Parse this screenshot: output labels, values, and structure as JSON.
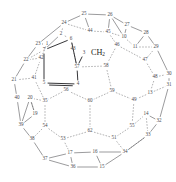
{
  "figure": {
    "kind": "fullerene-schlegel-diagram",
    "title": "",
    "molecule_label": "CH2",
    "molecule_label_base": "CH",
    "molecule_label_sub": "2",
    "colors": {
      "background": "#ffffff",
      "dashed_edge": "#6f6f72",
      "solid_edge": "#57575b",
      "bold_edge": "#2b2b2e",
      "node_text": "#4a4a4e",
      "group_text": "#1d1d20"
    },
    "nodes": [
      {
        "id": "25",
        "label": "25",
        "x": 84,
        "y": 14
      },
      {
        "id": "26",
        "label": "26",
        "x": 110,
        "y": 15
      },
      {
        "id": "24",
        "label": "24",
        "x": 64,
        "y": 23
      },
      {
        "id": "27",
        "label": "27",
        "x": 127,
        "y": 25
      },
      {
        "id": "2",
        "label": "2",
        "x": 61,
        "y": 34
      },
      {
        "id": "44",
        "label": "44",
        "x": 90,
        "y": 31
      },
      {
        "id": "45",
        "label": "45",
        "x": 108,
        "y": 32
      },
      {
        "id": "10",
        "label": "10",
        "x": 124,
        "y": 37
      },
      {
        "id": "28",
        "label": "28",
        "x": 146,
        "y": 33
      },
      {
        "id": "23",
        "label": "23",
        "x": 38,
        "y": 44
      },
      {
        "id": "6",
        "label": "6",
        "x": 71,
        "y": 39
      },
      {
        "id": "1",
        "label": "1",
        "x": 47,
        "y": 44
      },
      {
        "id": "46",
        "label": "46",
        "x": 117,
        "y": 45
      },
      {
        "id": "11",
        "label": "11",
        "x": 135,
        "y": 47
      },
      {
        "id": "29",
        "label": "29",
        "x": 156,
        "y": 47
      },
      {
        "id": "7",
        "label": "7",
        "x": 44,
        "y": 50
      },
      {
        "id": "43",
        "label": "43",
        "x": 73,
        "y": 49
      },
      {
        "id": "3",
        "label": "3",
        "x": 84,
        "y": 53
      },
      {
        "id": "22",
        "label": "22",
        "x": 26,
        "y": 60
      },
      {
        "id": "42",
        "label": "42",
        "x": 41,
        "y": 58
      },
      {
        "id": "47",
        "label": "47",
        "x": 145,
        "y": 60
      },
      {
        "id": "57",
        "label": "57",
        "x": 77,
        "y": 67
      },
      {
        "id": "58",
        "label": "58",
        "x": 106,
        "y": 66
      },
      {
        "id": "48",
        "label": "48",
        "x": 155,
        "y": 77
      },
      {
        "id": "30",
        "label": "30",
        "x": 169,
        "y": 74
      },
      {
        "id": "21",
        "label": "21",
        "x": 14,
        "y": 80
      },
      {
        "id": "41",
        "label": "41",
        "x": 34,
        "y": 78
      },
      {
        "id": "5",
        "label": "5",
        "x": 44,
        "y": 83
      },
      {
        "id": "4",
        "label": "4",
        "x": 78,
        "y": 84
      },
      {
        "id": "31",
        "label": "31",
        "x": 169,
        "y": 85
      },
      {
        "id": "56",
        "label": "56",
        "x": 66,
        "y": 90
      },
      {
        "id": "59",
        "label": "59",
        "x": 112,
        "y": 91
      },
      {
        "id": "13",
        "label": "13",
        "x": 150,
        "y": 93
      },
      {
        "id": "40",
        "label": "40",
        "x": 17,
        "y": 98
      },
      {
        "id": "20",
        "label": "20",
        "x": 30,
        "y": 98
      },
      {
        "id": "35",
        "label": "35",
        "x": 45,
        "y": 101
      },
      {
        "id": "60",
        "label": "60",
        "x": 90,
        "y": 101
      },
      {
        "id": "49",
        "label": "49",
        "x": 134,
        "y": 100
      },
      {
        "id": "19",
        "label": "19",
        "x": 35,
        "y": 114
      },
      {
        "id": "14",
        "label": "14",
        "x": 146,
        "y": 114
      },
      {
        "id": "32",
        "label": "32",
        "x": 159,
        "y": 121
      },
      {
        "id": "39",
        "label": "39",
        "x": 21,
        "y": 125
      },
      {
        "id": "54",
        "label": "54",
        "x": 45,
        "y": 126
      },
      {
        "id": "55",
        "label": "55",
        "x": 132,
        "y": 126
      },
      {
        "id": "62",
        "label": "62",
        "x": 90,
        "y": 131
      },
      {
        "id": "33",
        "label": "33",
        "x": 148,
        "y": 135
      },
      {
        "id": "38",
        "label": "38",
        "x": 32,
        "y": 139
      },
      {
        "id": "53",
        "label": "53",
        "x": 63,
        "y": 139
      },
      {
        "id": "51",
        "label": "51",
        "x": 114,
        "y": 138
      },
      {
        "id": "17",
        "label": "17",
        "x": 70,
        "y": 153
      },
      {
        "id": "16",
        "label": "16",
        "x": 95,
        "y": 152
      },
      {
        "id": "34",
        "label": "34",
        "x": 125,
        "y": 152
      },
      {
        "id": "37",
        "label": "37",
        "x": 45,
        "y": 159
      },
      {
        "id": "36",
        "label": "36",
        "x": 73,
        "y": 167
      },
      {
        "id": "15",
        "label": "15",
        "x": 102,
        "y": 167
      }
    ],
    "dashed_edges": [
      [
        "2",
        "24"
      ],
      [
        "2",
        "6"
      ],
      [
        "24",
        "44"
      ],
      [
        "44",
        "45"
      ],
      [
        "45",
        "46"
      ],
      [
        "45",
        "10"
      ],
      [
        "46",
        "58"
      ],
      [
        "46",
        "47"
      ],
      [
        "10",
        "11"
      ],
      [
        "11",
        "29"
      ],
      [
        "47",
        "48"
      ],
      [
        "47",
        "29"
      ],
      [
        "48",
        "13"
      ],
      [
        "48",
        "30"
      ],
      [
        "13",
        "49"
      ],
      [
        "13",
        "31"
      ],
      [
        "58",
        "59"
      ],
      [
        "58",
        "57"
      ],
      [
        "59",
        "49"
      ],
      [
        "59",
        "60"
      ],
      [
        "49",
        "55"
      ],
      [
        "55",
        "14"
      ],
      [
        "55",
        "51"
      ],
      [
        "60",
        "56"
      ],
      [
        "60",
        "62"
      ],
      [
        "56",
        "35"
      ],
      [
        "62",
        "53"
      ],
      [
        "62",
        "51"
      ],
      [
        "51",
        "34"
      ],
      [
        "53",
        "54"
      ],
      [
        "53",
        "17"
      ],
      [
        "54",
        "35"
      ],
      [
        "54",
        "38"
      ],
      [
        "35",
        "41"
      ],
      [
        "35",
        "20"
      ],
      [
        "41",
        "42"
      ],
      [
        "41",
        "21"
      ],
      [
        "42",
        "22"
      ],
      [
        "42",
        "1"
      ],
      [
        "1",
        "7"
      ],
      [
        "1",
        "23"
      ],
      [
        "7",
        "22"
      ],
      [
        "6",
        "43"
      ],
      [
        "57",
        "43"
      ],
      [
        "14",
        "33"
      ],
      [
        "19",
        "20"
      ],
      [
        "34",
        "33"
      ]
    ],
    "solid_edges": [
      [
        "25",
        "26"
      ],
      [
        "25",
        "24"
      ],
      [
        "25",
        "44"
      ],
      [
        "26",
        "27"
      ],
      [
        "26",
        "45"
      ],
      [
        "26",
        "10"
      ],
      [
        "27",
        "28"
      ],
      [
        "27",
        "10"
      ],
      [
        "28",
        "29"
      ],
      [
        "28",
        "11"
      ],
      [
        "29",
        "30"
      ],
      [
        "30",
        "31"
      ],
      [
        "31",
        "32"
      ],
      [
        "32",
        "33"
      ],
      [
        "32",
        "14"
      ],
      [
        "33",
        "34"
      ],
      [
        "34",
        "16"
      ],
      [
        "34",
        "15"
      ],
      [
        "16",
        "17"
      ],
      [
        "16",
        "15"
      ],
      [
        "17",
        "37"
      ],
      [
        "17",
        "36"
      ],
      [
        "36",
        "37"
      ],
      [
        "36",
        "15"
      ],
      [
        "37",
        "38"
      ],
      [
        "38",
        "39"
      ],
      [
        "39",
        "40"
      ],
      [
        "39",
        "19"
      ],
      [
        "40",
        "21"
      ],
      [
        "21",
        "22"
      ],
      [
        "22",
        "23"
      ],
      [
        "23",
        "24"
      ],
      [
        "23",
        "1"
      ],
      [
        "19",
        "20"
      ],
      [
        "20",
        "39"
      ],
      [
        "7",
        "2"
      ]
    ],
    "ring_edges": [
      [
        "6",
        "7"
      ],
      [
        "7",
        "5"
      ],
      [
        "5",
        "4"
      ],
      [
        "4",
        "57"
      ],
      [
        "57",
        "6"
      ]
    ],
    "double_bond": [
      "5",
      "4"
    ],
    "substituent_bond": [
      "3",
      "57"
    ],
    "substituent_anchor": {
      "x": 84,
      "y": 53
    },
    "node_count": 56,
    "cage_label": "C60"
  }
}
